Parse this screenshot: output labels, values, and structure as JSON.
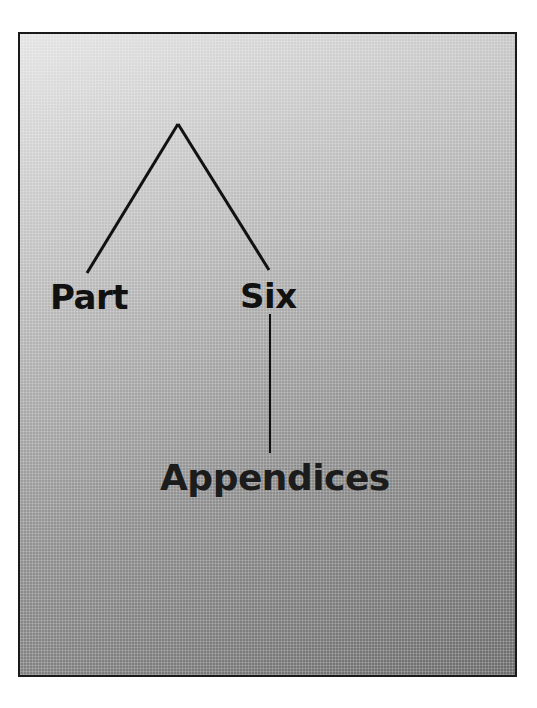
{
  "page": {
    "title_words": {
      "part": "Part",
      "six": "Six",
      "subtitle": "Appendices"
    }
  },
  "colors": {
    "frame_border": "#1a1a1a",
    "gradient_light": "#e4e4e4",
    "gradient_dark": "#6c6c6c",
    "text": "#111111"
  }
}
